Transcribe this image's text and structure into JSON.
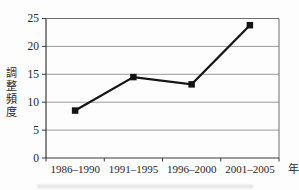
{
  "figure": {
    "background": "#fdfdfd",
    "grid_color": "#9a9a9a",
    "frame_color": "#6f6f6f",
    "axis_color": "#3a3a3a",
    "text_color": "#262626"
  },
  "chart_data": {
    "type": "line",
    "categories": [
      "1986-1990",
      "1991-1995",
      "1996-2000",
      "2001-2005"
    ],
    "values": [
      8.5,
      14.5,
      13.2,
      23.8
    ],
    "title": "",
    "xlabel": "年",
    "ylabel": "調整頻度",
    "ylim": [
      0,
      25
    ],
    "yticks": [
      0,
      5,
      10,
      15,
      20,
      25
    ],
    "grid": true,
    "legend": "none",
    "marker": "square",
    "line_color": "#141414",
    "marker_color": "#141414"
  }
}
